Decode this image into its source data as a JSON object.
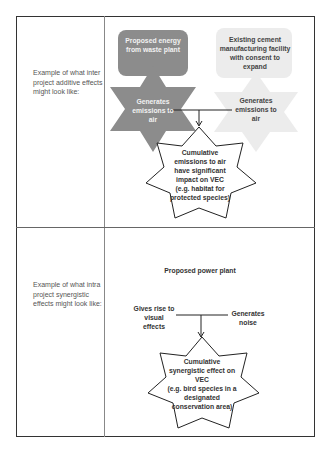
{
  "rows": [
    {
      "label": "Example of what inter project additive effects might look like:",
      "sources": [
        {
          "project": "Proposed energy from waste plant",
          "effect": "Generates emissions to air",
          "fill": "#8c8c8c"
        },
        {
          "project": "Existing cement manufacturing facility with consent to expand",
          "effect": "Generates emissions to air",
          "fill": "#ececec"
        }
      ],
      "outcome": {
        "lines": [
          "Cumulative",
          "emissions to air",
          "have significant",
          "impact on VEC",
          "(e.g. habitat for",
          "protected species)"
        ]
      }
    },
    {
      "label": "Example of what intra project synergistic effects might look like:",
      "project": "Proposed power plant",
      "effects": [
        "Gives rise to visual effects",
        "Generates noise"
      ],
      "outcome": {
        "lines": [
          "Cumulative",
          "synergistic effect on",
          "VEC",
          "(e.g. bird species in a",
          "designated",
          "conservation area)"
        ]
      }
    }
  ],
  "colors": {
    "dark_shape": "#8c8c8c",
    "light_shape": "#ececec",
    "outline": "#222222",
    "border": "#333333"
  }
}
